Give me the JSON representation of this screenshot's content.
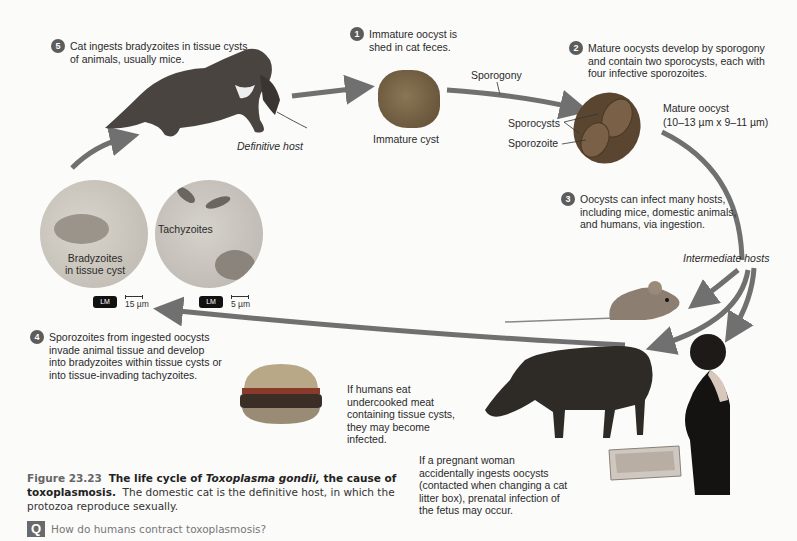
{
  "figure": {
    "number": "Figure 23.23",
    "title_part1": "The life cycle of ",
    "title_species": "Toxoplasma gondii,",
    "title_part2": " the cause of toxoplasmosis.",
    "description": "The domestic cat is the definitive host, in which the protozoa reproduce sexually.",
    "question_icon": "Q",
    "question": "How do humans contract toxoplasmosis?"
  },
  "steps": [
    {
      "number": "1",
      "text": "Immature oocyst is shed in cat feces."
    },
    {
      "number": "2",
      "text": "Mature oocysts develop by sporogony and contain two sporocysts, each with four infective sporozoites."
    },
    {
      "number": "3",
      "text": "Oocysts can infect many hosts, including mice, domestic animals, and humans, via ingestion."
    },
    {
      "number": "4",
      "text": "Sporozoites from ingested oocysts invade animal tissue and develop into bradyzoites within tissue cysts or into tissue-invading tachyzoites."
    },
    {
      "number": "5",
      "text": "Cat ingests bradyzoites in tissue cysts of animals, usually mice."
    }
  ],
  "labels": {
    "definitive_host": "Definitive host",
    "immature_cyst": "Immature cyst",
    "sporogony": "Sporogony",
    "sporocysts": "Sporocysts",
    "sporozoite": "Sporozoite",
    "mature_oocyst": "Mature oocyst",
    "mature_oocyst_size": "(10–13 µm x 9–11 µm)",
    "intermediate_hosts": "Intermediate hosts",
    "bradyzoites_1": "Bradyzoites",
    "bradyzoites_2": "in tissue cyst",
    "tachyzoites": "Tachyzoites",
    "lm": "LM",
    "scale_left": "15 µm",
    "scale_right": "5 µm"
  },
  "notes": {
    "meat": "If humans eat undercooked meat containing tissue cysts, they may become infected.",
    "pregnant": "If a pregnant woman accidentally ingests oocysts (contacted when changing a cat litter box), prenatal infection of the fetus may occur."
  },
  "colors": {
    "arrow": "#707070",
    "step_circle": "#5c5c5c",
    "oocyst": "#6b5a42"
  }
}
